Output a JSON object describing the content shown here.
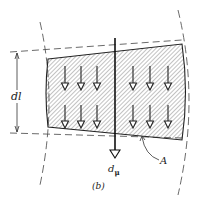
{
  "figure": {
    "caption": "(b)",
    "labels": {
      "dimension": "dl",
      "moment_main": "d",
      "moment_sub": "μ",
      "area": "A"
    },
    "colors": {
      "stroke": "#222222",
      "hatch": "#555555",
      "background": "#ffffff"
    },
    "arrow_columns_left": [
      65,
      81,
      97
    ],
    "arrow_columns_right": [
      133,
      150,
      168
    ],
    "arrow_rows": [
      {
        "y_start": 66,
        "y_end": 90
      },
      {
        "y_start": 105,
        "y_end": 128
      }
    ]
  }
}
